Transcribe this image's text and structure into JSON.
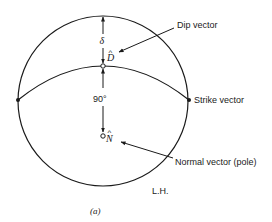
{
  "diagram": {
    "type": "stereonet-projection",
    "hemisphere_label": "L.H.",
    "caption": "(a)",
    "labels": {
      "dip_vector": "Dip vector",
      "strike_vector": "Strike vector",
      "normal_vector": "Normal vector (pole)",
      "dip_angle_symbol": "δ",
      "right_angle": "90°",
      "dip_symbol": "D",
      "normal_symbol": "N",
      "hat": "^"
    },
    "colors": {
      "stroke": "#1a1a1a",
      "background": "#ffffff"
    }
  }
}
